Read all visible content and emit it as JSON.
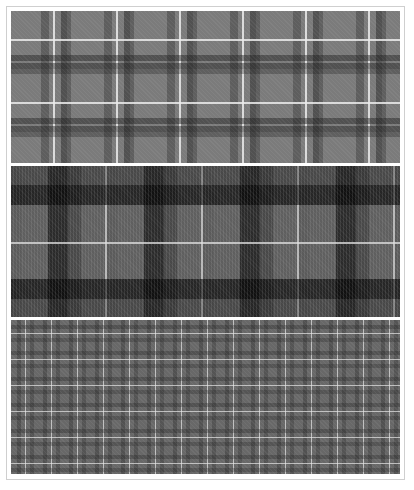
{
  "image": {
    "description": "Three grayscale tartan / plaid fabric swatches stacked vertically",
    "swatches": [
      {
        "name": "medium-grey-tartan",
        "base_color": "#7b7b7b",
        "dark_color": "#505050",
        "line_color": "#e0e0e0",
        "repeat_px": 63
      },
      {
        "name": "dark-grey-black-tartan",
        "base_color": "#5f5f5f",
        "dark_color": "#111111",
        "line_color": "#d5d5d5",
        "repeat_px": 95
      },
      {
        "name": "fine-grey-plaid",
        "base_color": "#686868",
        "dark_color": "#4a4a4a",
        "line_color": "#d8d8d8",
        "repeat_px": 26
      }
    ]
  }
}
